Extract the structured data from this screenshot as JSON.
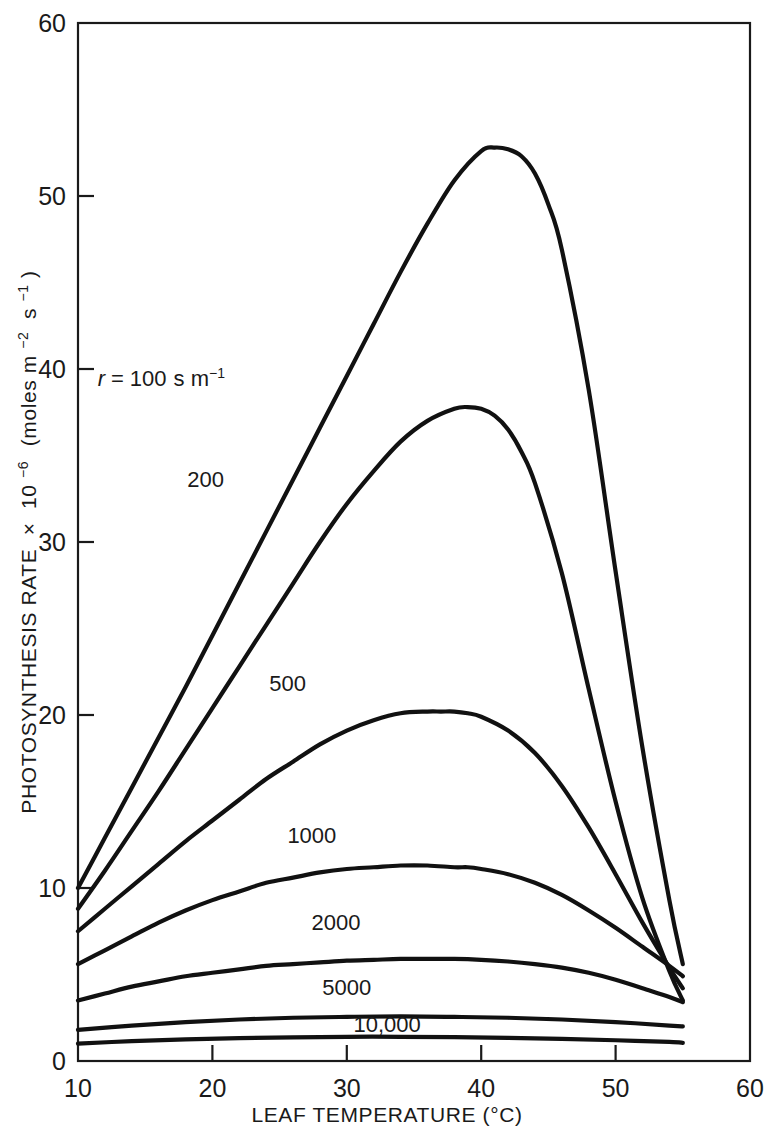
{
  "chart_data": {
    "type": "line",
    "title": "",
    "xlabel": "LEAF TEMPERATURE (°C)",
    "ylabel": "PHOTOSYNTHESIS RATE × 10⁻⁶ (moles m⁻² s⁻¹)",
    "ylabel_parts": {
      "main": "PHOTOSYNTHESIS RATE",
      "times": "×",
      "base": "10",
      "exponent": "−6",
      "units_open": "(moles m",
      "units_exp1": "−2",
      "units_s": "s",
      "units_exp2": "−1",
      "units_close": ")"
    },
    "xlim": [
      10,
      60
    ],
    "ylim": [
      0,
      60
    ],
    "xticks": [
      10,
      20,
      30,
      40,
      50,
      60
    ],
    "xtick_labels": [
      "10",
      "20",
      "30",
      "40",
      "50",
      "60"
    ],
    "yticks": [
      0,
      10,
      20,
      30,
      40,
      50,
      60
    ],
    "ytick_labels": [
      "0",
      "10",
      "20",
      "30",
      "40",
      "50",
      "60"
    ],
    "grid": false,
    "legend_position": "inline-curve-labels",
    "series_parameter_name": "r",
    "series_parameter_units": "s m⁻¹",
    "annotation_first": "r = 100 s m⁻¹",
    "series": [
      {
        "name": "100",
        "label": "100",
        "label_x": 16.2,
        "label_y": 39.0,
        "x": [
          10,
          12,
          14,
          16,
          18,
          20,
          22,
          24,
          26,
          28,
          30,
          32,
          34,
          36,
          38,
          40,
          41,
          42,
          43,
          44,
          45,
          46,
          48,
          50,
          52,
          54,
          55
        ],
        "y": [
          10.0,
          12.9,
          15.8,
          18.7,
          21.6,
          24.6,
          27.6,
          30.6,
          33.6,
          36.6,
          39.6,
          42.6,
          45.6,
          48.4,
          50.9,
          52.6,
          52.8,
          52.7,
          52.3,
          51.3,
          49.5,
          46.9,
          38.8,
          28.3,
          18.1,
          9.3,
          5.6
        ]
      },
      {
        "name": "200",
        "label": "200",
        "label_x": 19.5,
        "label_y": 33.2,
        "x": [
          10,
          12,
          14,
          16,
          18,
          20,
          22,
          24,
          26,
          28,
          30,
          32,
          34,
          36,
          38,
          39,
          40,
          41,
          42,
          43,
          44,
          46,
          48,
          50,
          52,
          54,
          55
        ],
        "y": [
          8.8,
          11.0,
          13.3,
          15.6,
          18.0,
          20.4,
          22.8,
          25.2,
          27.6,
          30.0,
          32.2,
          34.1,
          35.8,
          37.0,
          37.7,
          37.8,
          37.7,
          37.3,
          36.5,
          35.2,
          33.4,
          28.2,
          21.5,
          15.0,
          9.4,
          5.2,
          3.5
        ]
      },
      {
        "name": "500",
        "label": "500",
        "label_x": 25.6,
        "label_y": 21.4,
        "x": [
          10,
          12,
          14,
          16,
          18,
          20,
          22,
          24,
          26,
          28,
          30,
          32,
          34,
          36,
          37,
          38,
          39,
          40,
          42,
          44,
          46,
          48,
          50,
          52,
          54,
          55
        ],
        "y": [
          7.5,
          8.8,
          10.1,
          11.4,
          12.7,
          13.9,
          15.1,
          16.3,
          17.3,
          18.3,
          19.1,
          19.7,
          20.1,
          20.2,
          20.2,
          20.2,
          20.1,
          19.9,
          19.1,
          17.8,
          15.9,
          13.5,
          10.8,
          8.0,
          5.4,
          4.2
        ]
      },
      {
        "name": "1000",
        "label": "1000",
        "label_x": 27.4,
        "label_y": 12.6,
        "x": [
          10,
          12,
          14,
          16,
          18,
          20,
          22,
          24,
          26,
          28,
          30,
          32,
          34,
          36,
          38,
          39,
          40,
          42,
          44,
          46,
          48,
          50,
          52,
          54,
          55
        ],
        "y": [
          5.6,
          6.4,
          7.2,
          8.0,
          8.7,
          9.3,
          9.8,
          10.3,
          10.6,
          10.9,
          11.1,
          11.2,
          11.3,
          11.3,
          11.2,
          11.2,
          11.1,
          10.8,
          10.3,
          9.6,
          8.7,
          7.7,
          6.6,
          5.5,
          4.9
        ]
      },
      {
        "name": "2000",
        "label": "2000",
        "label_x": 29.2,
        "label_y": 7.6,
        "x": [
          10,
          12,
          14,
          16,
          18,
          20,
          22,
          24,
          26,
          28,
          30,
          32,
          34,
          36,
          38,
          40,
          42,
          44,
          46,
          48,
          50,
          52,
          54,
          55
        ],
        "y": [
          3.5,
          3.9,
          4.3,
          4.6,
          4.9,
          5.1,
          5.3,
          5.5,
          5.6,
          5.7,
          5.8,
          5.85,
          5.9,
          5.9,
          5.9,
          5.85,
          5.75,
          5.6,
          5.4,
          5.1,
          4.7,
          4.2,
          3.7,
          3.4
        ]
      },
      {
        "name": "5000",
        "label": "5000",
        "label_x": 30.0,
        "label_y": 3.8,
        "x": [
          10,
          14,
          18,
          22,
          26,
          30,
          34,
          38,
          42,
          46,
          50,
          54,
          55
        ],
        "y": [
          1.8,
          2.05,
          2.25,
          2.4,
          2.5,
          2.55,
          2.58,
          2.55,
          2.5,
          2.4,
          2.25,
          2.05,
          2.0
        ]
      },
      {
        "name": "10,000",
        "label": "10,000",
        "label_x": 33.0,
        "label_y": 1.7,
        "x": [
          10,
          14,
          18,
          22,
          26,
          30,
          34,
          38,
          42,
          46,
          50,
          54,
          55
        ],
        "y": [
          1.0,
          1.15,
          1.25,
          1.32,
          1.37,
          1.4,
          1.4,
          1.38,
          1.34,
          1.28,
          1.2,
          1.1,
          1.05
        ]
      }
    ]
  },
  "colors": {
    "curve": "#111111",
    "axis": "#1a1a1a",
    "background": "#ffffff"
  }
}
